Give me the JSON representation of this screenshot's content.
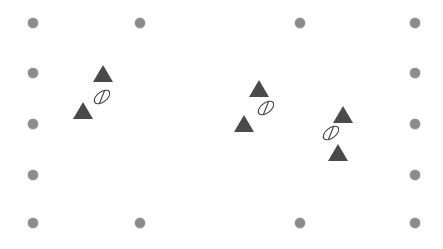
{
  "canvas": {
    "width": 443,
    "height": 249,
    "background_color": "#ffffff",
    "title": "Marker scatter canvas"
  },
  "palette": {
    "dot_color": "#8c8c8c",
    "triangle_color": "#4a4a4a",
    "ellipse_stroke_color": "#3f3f3f",
    "ellipse_fill_color": "#ffffff"
  },
  "grid_dots": {
    "label": "grid dot",
    "count": 18,
    "diameter": 10,
    "items": [
      {
        "name": "grid-dot-top-1",
        "cx": 33,
        "cy": 23
      },
      {
        "name": "grid-dot-top-2",
        "cx": 140,
        "cy": 23
      },
      {
        "name": "grid-dot-top-3",
        "cx": 300,
        "cy": 23
      },
      {
        "name": "grid-dot-top-4",
        "cx": 415,
        "cy": 23
      },
      {
        "name": "grid-dot-left-2",
        "cx": 33,
        "cy": 73
      },
      {
        "name": "grid-dot-right-2",
        "cx": 415,
        "cy": 73
      },
      {
        "name": "grid-dot-left-3",
        "cx": 33,
        "cy": 124
      },
      {
        "name": "grid-dot-right-3",
        "cx": 415,
        "cy": 124
      },
      {
        "name": "grid-dot-left-4",
        "cx": 33,
        "cy": 175
      },
      {
        "name": "grid-dot-right-4",
        "cx": 415,
        "cy": 175
      },
      {
        "name": "grid-dot-bottom-1",
        "cx": 33,
        "cy": 223
      },
      {
        "name": "grid-dot-bottom-2",
        "cx": 140,
        "cy": 223
      },
      {
        "name": "grid-dot-bottom-3",
        "cx": 300,
        "cy": 223
      },
      {
        "name": "grid-dot-bottom-4",
        "cx": 415,
        "cy": 223
      }
    ]
  },
  "triangle_markers": {
    "label": "triangle marker",
    "count": 6,
    "items": [
      {
        "name": "triangle-marker-left-upper",
        "cx": 103,
        "cy": 73,
        "width": 20,
        "height": 17
      },
      {
        "name": "triangle-marker-left-lower",
        "cx": 83,
        "cy": 110,
        "width": 20,
        "height": 17
      },
      {
        "name": "triangle-marker-middle-upper",
        "cx": 259,
        "cy": 88,
        "width": 20,
        "height": 17
      },
      {
        "name": "triangle-marker-middle-lower",
        "cx": 244,
        "cy": 123,
        "width": 20,
        "height": 17
      },
      {
        "name": "triangle-marker-right-upper",
        "cx": 343,
        "cy": 114,
        "width": 20,
        "height": 17
      },
      {
        "name": "triangle-marker-right-lower",
        "cx": 338,
        "cy": 152,
        "width": 20,
        "height": 17
      }
    ]
  },
  "ellipse_markers": {
    "label": "tilted ellipse marker",
    "count": 3,
    "items": [
      {
        "name": "ellipse-marker-left",
        "cx": 102,
        "cy": 97,
        "rx": 9,
        "ry": 5,
        "rotation": -38
      },
      {
        "name": "ellipse-marker-middle",
        "cx": 266,
        "cy": 108,
        "rx": 9,
        "ry": 5,
        "rotation": -38
      },
      {
        "name": "ellipse-marker-right",
        "cx": 331,
        "cy": 133,
        "rx": 9,
        "ry": 5,
        "rotation": -38
      }
    ]
  }
}
